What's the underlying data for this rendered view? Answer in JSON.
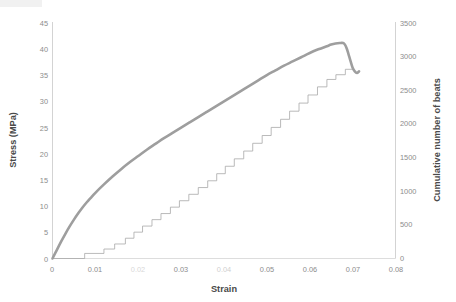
{
  "figure": {
    "background_color": "#ffffff",
    "has_title": false,
    "width": 456,
    "height": 302
  },
  "axes": {
    "x": {
      "label": "Strain",
      "ticks": [
        "0",
        "0.01",
        "0.02",
        "0.03",
        "0.04",
        "0.05",
        "0.06",
        "0.07",
        "0.08"
      ],
      "tick_values": [
        0,
        0.01,
        0.02,
        0.03,
        0.04,
        0.05,
        0.06,
        0.07,
        0.08
      ],
      "range": [
        0,
        0.08
      ],
      "degraded_ticks": [
        "0.02",
        "0.04"
      ]
    },
    "y_left": {
      "label": "Stress (MPa)",
      "ticks": [
        "0",
        "5",
        "10",
        "15",
        "20",
        "25",
        "30",
        "35",
        "40",
        "45"
      ],
      "tick_values": [
        0,
        5,
        10,
        15,
        20,
        25,
        30,
        35,
        40,
        45
      ],
      "range": [
        0,
        45
      ],
      "color": "#8c8c8c"
    },
    "y_right": {
      "label": "Cumulative number of beats",
      "ticks": [
        "0",
        "500",
        "1000",
        "1500",
        "2000",
        "2500",
        "3000",
        "3500"
      ],
      "tick_values": [
        0,
        500,
        1000,
        1500,
        2000,
        2500,
        3000,
        3500
      ],
      "range": [
        0,
        3500
      ],
      "color": "#8c8c8c"
    }
  },
  "chart_data": {
    "type": "line",
    "title": "",
    "xlabel": "Strain",
    "ylabel": "Stress (MPa)",
    "ylabel_secondary": "Cumulative number of beats",
    "xlim": [
      0,
      0.08
    ],
    "ylim": [
      0,
      45
    ],
    "ylim_secondary": [
      0,
      3500
    ],
    "grid": false,
    "legend": "none",
    "series": [
      {
        "name": "Stress (MPa)",
        "axis": "left",
        "color": "#9e9e9e",
        "line_width": 2.6,
        "style": "smooth",
        "x": [
          0.0,
          0.001,
          0.002,
          0.003,
          0.004,
          0.005,
          0.006,
          0.007,
          0.008,
          0.009,
          0.01,
          0.012,
          0.014,
          0.016,
          0.018,
          0.02,
          0.022,
          0.024,
          0.026,
          0.028,
          0.03,
          0.032,
          0.034,
          0.036,
          0.038,
          0.04,
          0.042,
          0.044,
          0.046,
          0.048,
          0.05,
          0.052,
          0.054,
          0.056,
          0.058,
          0.06,
          0.062,
          0.064,
          0.065,
          0.066,
          0.067,
          0.0678,
          0.0682,
          0.0686,
          0.069,
          0.0695,
          0.07,
          0.0705,
          0.071,
          0.0715
        ],
        "y": [
          0.0,
          1.6,
          3.2,
          4.7,
          6.1,
          7.4,
          8.6,
          9.7,
          10.7,
          11.6,
          12.5,
          14.1,
          15.6,
          17.0,
          18.3,
          19.5,
          20.7,
          21.8,
          22.9,
          23.9,
          24.9,
          25.9,
          26.9,
          27.9,
          28.9,
          29.9,
          30.9,
          31.9,
          32.9,
          33.9,
          34.9,
          35.8,
          36.7,
          37.5,
          38.3,
          39.1,
          39.8,
          40.4,
          40.7,
          40.9,
          41.0,
          41.0,
          40.7,
          40.0,
          39.0,
          37.6,
          36.3,
          35.6,
          35.3,
          35.6
        ]
      },
      {
        "name": "Cumulative number of beats",
        "axis": "right",
        "color": "#a8a8a8",
        "line_width": 0.8,
        "style": "step",
        "x": [
          0.0,
          0.0075,
          0.0075,
          0.012,
          0.012,
          0.0145,
          0.0145,
          0.017,
          0.017,
          0.019,
          0.019,
          0.021,
          0.021,
          0.0232,
          0.0232,
          0.0253,
          0.0253,
          0.0275,
          0.0275,
          0.0296,
          0.0296,
          0.0318,
          0.0318,
          0.034,
          0.034,
          0.0362,
          0.0362,
          0.0383,
          0.0383,
          0.0403,
          0.0403,
          0.0424,
          0.0424,
          0.0446,
          0.0446,
          0.0467,
          0.0467,
          0.0489,
          0.0489,
          0.051,
          0.051,
          0.0532,
          0.0532,
          0.0553,
          0.0553,
          0.0575,
          0.0575,
          0.0596,
          0.0596,
          0.0618,
          0.0618,
          0.064,
          0.064,
          0.0661,
          0.0661,
          0.0683,
          0.0683,
          0.07
        ],
        "y": [
          0,
          0,
          75,
          75,
          140,
          140,
          215,
          215,
          300,
          300,
          390,
          390,
          480,
          480,
          575,
          575,
          665,
          665,
          760,
          760,
          855,
          855,
          950,
          950,
          1050,
          1050,
          1150,
          1150,
          1255,
          1255,
          1365,
          1365,
          1475,
          1475,
          1590,
          1590,
          1705,
          1705,
          1820,
          1820,
          1940,
          1940,
          2060,
          2060,
          2180,
          2180,
          2300,
          2300,
          2420,
          2420,
          2540,
          2540,
          2650,
          2650,
          2720,
          2720,
          2800,
          2800
        ]
      }
    ]
  }
}
